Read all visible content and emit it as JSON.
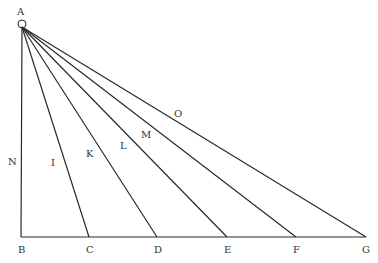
{
  "diagram": {
    "apex": {
      "label": "A",
      "x": 22,
      "y": 27
    },
    "baseline_y": 237,
    "base_points": [
      {
        "label": "B",
        "x": 21
      },
      {
        "label": "C",
        "x": 89
      },
      {
        "label": "D",
        "x": 157
      },
      {
        "label": "E",
        "x": 227
      },
      {
        "label": "F",
        "x": 296
      },
      {
        "label": "G",
        "x": 366
      }
    ],
    "line_labels": [
      {
        "label": "N",
        "x": 12,
        "y": 165
      },
      {
        "label": "I",
        "x": 52,
        "y": 165
      },
      {
        "label": "K",
        "x": 87,
        "y": 157
      },
      {
        "label": "L",
        "x": 120,
        "y": 149
      },
      {
        "label": "M",
        "x": 143,
        "y": 138
      },
      {
        "label": "O",
        "x": 175,
        "y": 117
      }
    ]
  }
}
